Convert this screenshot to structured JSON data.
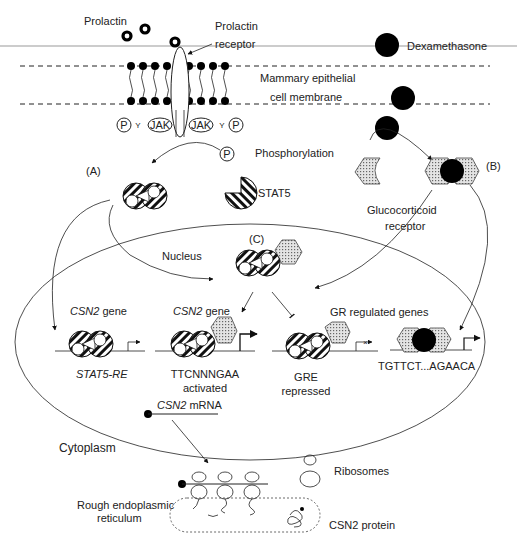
{
  "labels": {
    "prolactin": "Prolactin",
    "prolactin_receptor_1": "Prolactin",
    "prolactin_receptor_2": "receptor",
    "dexamethasone": "Dexamethasone",
    "membrane_1": "Mammary epithelial",
    "membrane_2": "cell membrane",
    "phosphorylation": "Phosphorylation",
    "p": "P",
    "jak": "JAK",
    "y": "Y",
    "panel_a": "(A)",
    "panel_b": "(B)",
    "panel_c": "(C)",
    "stat5": "STAT5",
    "gr_1": "Glucocorticoid",
    "gr_2": "receptor",
    "nucleus": "Nucleus",
    "csn2_gene_a": "CSN2",
    "csn2_gene_b": "CSN2",
    "gene_suffix": " gene",
    "stat5_re": "STAT5-RE",
    "seq_activated": "TTCNNNGAA",
    "activated": "activated",
    "gr_regulated": "GR regulated genes",
    "gre": "GRE",
    "repressed": "repressed",
    "seq_gre": "TGTTCT...AGAACA",
    "csn2_mrna_it": "CSN2",
    "mrna": " mRNA",
    "cytoplasm": "Cytoplasm",
    "ribosomes": "Ribosomes",
    "rer_1": "Rough endoplasmic",
    "rer_2": "reticulum",
    "csn2_protein": "CSN2 protein"
  }
}
